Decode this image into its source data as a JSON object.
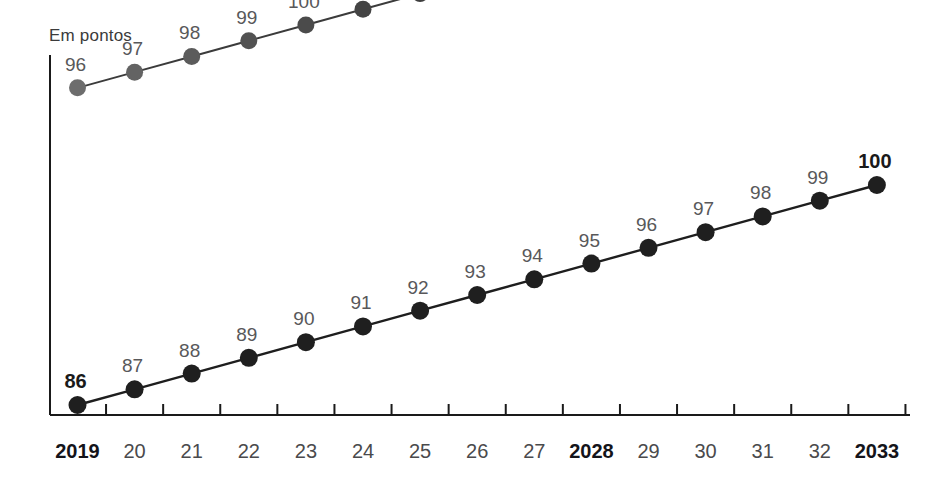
{
  "chart_data": {
    "type": "line",
    "title": "",
    "ylabel": "Em pontos",
    "xlabel": "",
    "grid": false,
    "legend": "none",
    "categories": [
      "2019",
      "20",
      "21",
      "22",
      "23",
      "24",
      "25",
      "26",
      "27",
      "2028",
      "29",
      "30",
      "31",
      "32",
      "2033"
    ],
    "category_bold": [
      true,
      false,
      false,
      false,
      false,
      false,
      false,
      false,
      false,
      true,
      false,
      false,
      false,
      false,
      true
    ],
    "xlim": [
      2019,
      2033
    ],
    "ylim": [
      85,
      106
    ],
    "series": [
      {
        "name": "upper-series",
        "x": [
          "2019",
          "20",
          "21",
          "22",
          "23",
          "24",
          "25",
          "26",
          "27",
          "2028"
        ],
        "values": [
          96,
          97,
          98,
          99,
          100,
          101,
          102,
          103,
          104,
          105
        ],
        "labels": [
          "96",
          "97",
          "98",
          "99",
          "100",
          "101",
          "102",
          "103",
          "104",
          "105"
        ],
        "label_bold": [
          false,
          false,
          false,
          false,
          false,
          false,
          false,
          false,
          false,
          true
        ],
        "color": "#3b3b3b",
        "marker_colors": [
          "#6d6d6d",
          "#636363",
          "#5b5b5b",
          "#525252",
          "#4b4b4b",
          "#444444",
          "#3e3e3e",
          "#3a3a3a",
          "#353535",
          "#303030"
        ]
      },
      {
        "name": "lower-series",
        "x": [
          "2019",
          "20",
          "21",
          "22",
          "23",
          "24",
          "25",
          "26",
          "27",
          "2028",
          "29",
          "30",
          "31",
          "32",
          "2033"
        ],
        "values": [
          86,
          87,
          88,
          89,
          90,
          91,
          92,
          93,
          94,
          95,
          96,
          97,
          98,
          99,
          100
        ],
        "labels": [
          "86",
          "87",
          "88",
          "89",
          "90",
          "91",
          "92",
          "93",
          "94",
          "95",
          "96",
          "97",
          "98",
          "99",
          "100"
        ],
        "label_bold": [
          true,
          false,
          false,
          false,
          false,
          false,
          false,
          false,
          false,
          false,
          false,
          false,
          false,
          false,
          true
        ],
        "color": "#1e1e1e",
        "marker_colors": [
          "#1f1f1f",
          "#1f1f1f",
          "#1f1f1f",
          "#1f1f1f",
          "#1f1f1f",
          "#1f1f1f",
          "#1f1f1f",
          "#1f1f1f",
          "#1f1f1f",
          "#1f1f1f",
          "#1f1f1f",
          "#1f1f1f",
          "#1f1f1f",
          "#1f1f1f",
          "#1f1f1f"
        ]
      }
    ],
    "axis_color": "#1a1a1a",
    "label_color": "#58585a"
  }
}
